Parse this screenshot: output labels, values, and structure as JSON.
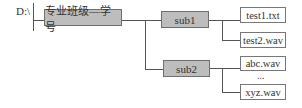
{
  "diagram": {
    "root": {
      "label": "D:\\"
    },
    "folder": {
      "label": "专业班级—学号"
    },
    "subfolders": [
      {
        "label": "sub1",
        "files": [
          "test1.txt",
          "test2.wav"
        ]
      },
      {
        "label": "sub2",
        "files": [
          "abc.wav",
          "xyz.wav"
        ],
        "ellipsis": "..."
      }
    ]
  },
  "colors": {
    "folder_fill": "#bdbdbd",
    "folder_border": "#6f6f6f",
    "file_fill": "#ffffff",
    "line": "#555555"
  }
}
